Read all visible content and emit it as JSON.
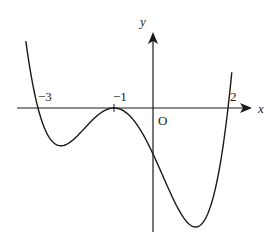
{
  "chart_data": {
    "type": "line",
    "title": "",
    "xlabel": "x",
    "ylabel": "y",
    "origin_label": "O",
    "function": "y = k(x+3)(x+1)^2(x-2), k>0",
    "roots": [
      -3,
      -1,
      2
    ],
    "tick_labels": [
      "−3",
      "−1",
      "2"
    ],
    "tick_values": [
      -3,
      -1,
      2
    ],
    "double_root": -1,
    "grid": false,
    "xlim": [
      -3.6,
      2.6
    ],
    "series": [
      {
        "name": "f(x)",
        "x": [
          -3.3,
          -3,
          -2.5,
          -2.2,
          -2,
          -1.5,
          -1,
          -0.5,
          0,
          0.5,
          1,
          1.1,
          1.5,
          2,
          2.1
        ],
        "y_relative": [
          5.6,
          0,
          -3.4,
          -4.8,
          -4,
          -2.2,
          0,
          -1.9,
          -6,
          -11.3,
          -16,
          -16.3,
          -13.7,
          0,
          4.6
        ]
      }
    ],
    "color": "#1a1a1a"
  }
}
